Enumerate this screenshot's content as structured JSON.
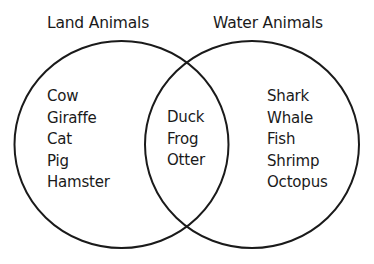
{
  "diagram": {
    "type": "venn",
    "sets": [
      {
        "label": "Land Animals",
        "only": [
          "Cow",
          "Giraffe",
          "Cat",
          "Pig",
          "Hamster"
        ]
      },
      {
        "label": "Water Animals",
        "only": [
          "Shark",
          "Whale",
          "Fish",
          "Shrimp",
          "Octopus"
        ]
      }
    ],
    "intersection": [
      "Duck",
      "Frog",
      "Otter"
    ],
    "colors": {
      "stroke": "#1a1a1a",
      "text": "#1a1a1a",
      "background": "#ffffff"
    }
  }
}
